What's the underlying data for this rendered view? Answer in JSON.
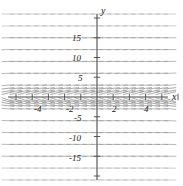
{
  "figure": {
    "width": 183,
    "height": 186,
    "background": "#ffffff",
    "axis_color": "#4a4a4a",
    "field_color": "#9a9a9a",
    "label_color": "#1a1a1a"
  },
  "axes": {
    "x_axis_label": "x",
    "y_axis_label": "y",
    "origin_px": {
      "x": 97,
      "y": 97
    },
    "x_unit_px": 16.2,
    "y_unit_px": 3.95
  },
  "chart_data": {
    "type": "scatter",
    "title": "",
    "subtitle": "",
    "xlabel": "x",
    "ylabel": "y",
    "grid": false,
    "legend": false,
    "xlim": [
      -5.8,
      5.0
    ],
    "ylim": [
      -22.5,
      22.5
    ],
    "xticks": [
      -5,
      -4,
      -3,
      -2,
      -1,
      1,
      2,
      3,
      4,
      5
    ],
    "yticks": [
      -20,
      -15,
      -10,
      -5,
      5,
      10,
      15,
      20
    ],
    "xtick_labels": [
      "-4",
      "-2",
      "2",
      "4"
    ],
    "xtick_label_values": [
      -4,
      -2,
      2,
      4
    ],
    "ytick_labels": [
      "15",
      "10",
      "5",
      "-5",
      "-10",
      "-15"
    ],
    "ytick_label_values": [
      15,
      10,
      5,
      -5,
      -10,
      -15
    ],
    "field": {
      "x_samples": [
        -5.5,
        -5.0,
        -4.5,
        -4.0,
        -3.5,
        -3.0,
        -2.5,
        -2.0,
        -1.5,
        -1.0,
        -0.5,
        0.0,
        0.5,
        1.0,
        1.5,
        2.0,
        2.5,
        3.0,
        3.5,
        4.0,
        4.5
      ],
      "y_samples": [
        -21,
        -18,
        -15,
        -12,
        -9,
        -6,
        -3,
        3,
        6,
        9,
        12,
        15,
        18,
        21
      ],
      "segment_length_px": 12,
      "slope_model": "dy/dx proportional to 1/y : segments steep near x-axis, shallow far away"
    }
  },
  "tick_labels": {
    "x": [
      {
        "text": "-4",
        "left": 34,
        "top": 105
      },
      {
        "text": "-2",
        "left": 66,
        "top": 105
      },
      {
        "text": "2",
        "left": 112,
        "top": 105
      },
      {
        "text": "4",
        "left": 144,
        "top": 105
      }
    ],
    "y": [
      {
        "text": "15",
        "left": 72,
        "top": 34
      },
      {
        "text": "10",
        "left": 72,
        "top": 54
      },
      {
        "text": "5",
        "left": 78,
        "top": 74
      },
      {
        "text": "-5",
        "left": 74,
        "top": 114
      },
      {
        "text": "-10",
        "left": 69,
        "top": 134
      },
      {
        "text": "-15",
        "left": 69,
        "top": 154
      }
    ]
  },
  "axis_names": {
    "x": {
      "text": "x",
      "left": 172,
      "top": 92
    },
    "y": {
      "text": "y",
      "left": 101,
      "top": 6
    }
  }
}
